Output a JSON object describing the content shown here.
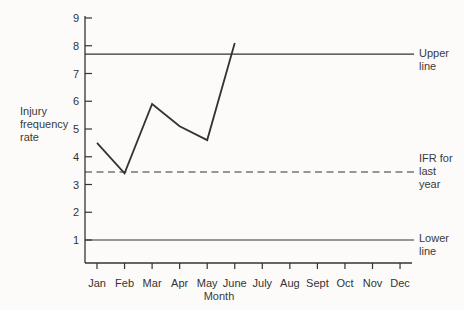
{
  "figure": {
    "background_color": "#fcfbf9",
    "ink_color": "#333333"
  },
  "chart_data": {
    "type": "line",
    "title": "",
    "xlabel": "Month",
    "ylabel": "Injury frequency rate",
    "ylabel_lines": [
      "Injury",
      "frequency",
      "rate"
    ],
    "categories": [
      "Jan",
      "Feb",
      "Mar",
      "Apr",
      "May",
      "June",
      "July",
      "Aug",
      "Sept",
      "Oct",
      "Nov",
      "Dec"
    ],
    "yticks": [
      1,
      2,
      3,
      4,
      5,
      6,
      7,
      8,
      9
    ],
    "ylim": [
      0.2,
      9
    ],
    "grid": false,
    "legend": "none",
    "series": [
      {
        "name": "injury-frequency-rate-current",
        "x": [
          "Jan",
          "Feb",
          "Mar",
          "Apr",
          "May",
          "June"
        ],
        "values": [
          4.5,
          3.4,
          5.9,
          5.1,
          4.6,
          8.1
        ]
      }
    ],
    "reference_lines": [
      {
        "name": "upper-line",
        "value": 7.7,
        "style": "solid",
        "label": "Upper line",
        "label_lines": [
          "Upper",
          "line"
        ]
      },
      {
        "name": "ifr-last-year",
        "value": 3.45,
        "style": "dashed",
        "label": "IFR for last year",
        "label_lines": [
          "IFR for",
          "last",
          "year"
        ]
      },
      {
        "name": "lower-line",
        "value": 1.0,
        "style": "solid",
        "label": "Lower line",
        "label_lines": [
          "Lower",
          "line"
        ]
      }
    ]
  }
}
